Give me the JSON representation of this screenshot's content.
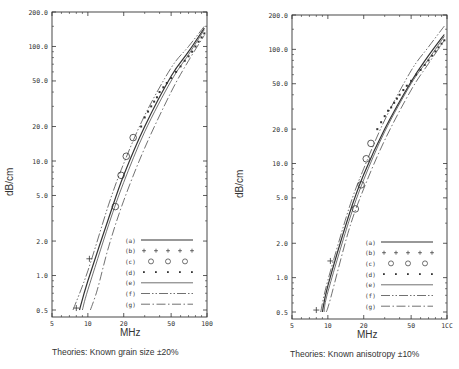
{
  "chart_data": [
    {
      "type": "line",
      "title": "",
      "caption": "Theories: Known grain size ±20%",
      "xlabel": "MHz",
      "ylabel": "dB/cm",
      "xscale": "log",
      "yscale": "log",
      "xlim": [
        5,
        100
      ],
      "ylim": [
        0.5,
        200
      ],
      "x_ticks": [
        "5",
        "10",
        "20",
        "50",
        "100"
      ],
      "y_ticks": [
        "200.0",
        "100.0",
        "50.0",
        "20.0",
        "10.0",
        "5.0",
        "2.0",
        "1.0",
        "0.5"
      ],
      "legend": [
        {
          "key": "(a)",
          "style": "solid"
        },
        {
          "key": "(b)",
          "style": "plus-markers"
        },
        {
          "key": "(c)",
          "style": "circle-markers"
        },
        {
          "key": "(d)",
          "style": "dot-markers"
        },
        {
          "key": "(e)",
          "style": "thin-solid"
        },
        {
          "key": "(f)",
          "style": "dash-dot-dot"
        },
        {
          "key": "(g)",
          "style": "dash-dot"
        }
      ],
      "legend_position": "lower right",
      "series": [
        {
          "name": "(a)",
          "x": [
            8.5,
            10,
            15,
            20,
            30,
            50,
            70,
            95
          ],
          "y": [
            0.5,
            0.9,
            3.2,
            7.5,
            20,
            55,
            90,
            145
          ]
        },
        {
          "name": "(b)",
          "x": [
            8,
            10.3
          ],
          "y": [
            0.52,
            1.4
          ]
        },
        {
          "name": "(c)",
          "x": [
            17,
            19,
            21,
            24
          ],
          "y": [
            4.0,
            7.5,
            11.0,
            16.0
          ]
        },
        {
          "name": "(d)",
          "x": [
            28,
            30,
            32,
            34,
            36,
            38,
            40,
            43,
            46,
            50,
            55,
            60,
            65,
            70,
            75,
            80,
            85,
            90,
            95
          ],
          "y": [
            20,
            24,
            27,
            30,
            33,
            36,
            40,
            44,
            48,
            53,
            60,
            67,
            75,
            82,
            90,
            100,
            110,
            120,
            130
          ]
        },
        {
          "name": "(e)",
          "x": [
            9,
            10,
            15,
            20,
            30,
            50,
            70,
            95
          ],
          "y": [
            0.5,
            0.75,
            2.8,
            6.5,
            18,
            50,
            85,
            140
          ]
        },
        {
          "name": "(f)",
          "x": [
            7.5,
            10,
            15,
            20,
            30,
            50,
            70,
            95
          ],
          "y": [
            0.5,
            1.1,
            4.2,
            9.5,
            25,
            65,
            100,
            150
          ]
        },
        {
          "name": "(g)",
          "x": [
            10.5,
            12,
            15,
            20,
            30,
            50,
            70,
            95
          ],
          "y": [
            0.5,
            0.75,
            1.8,
            4.5,
            13,
            40,
            75,
            125
          ]
        }
      ]
    },
    {
      "type": "line",
      "title": "",
      "caption": "Theories: Known anisotropy ±10%",
      "xlabel": "MHz",
      "ylabel": "dB/cm",
      "xscale": "log",
      "yscale": "log",
      "xlim": [
        5,
        100
      ],
      "ylim": [
        0.5,
        200
      ],
      "x_ticks": [
        "5",
        "10",
        "20",
        "50",
        "1CC"
      ],
      "y_ticks": [
        "200.0",
        "100.0",
        "50.0",
        "20.0",
        "10.0",
        "5.0",
        "2.0",
        "1.0",
        "0.5"
      ],
      "legend": [
        {
          "key": "(a)",
          "style": "solid"
        },
        {
          "key": "(b)",
          "style": "plus-markers"
        },
        {
          "key": "(c)",
          "style": "circle-markers"
        },
        {
          "key": "(d)",
          "style": "dot-markers"
        },
        {
          "key": "(e)",
          "style": "thin-solid"
        },
        {
          "key": "(f)",
          "style": "dash-dot-dot"
        },
        {
          "key": "(g)",
          "style": "dash-dot"
        }
      ],
      "legend_position": "lower right",
      "series": [
        {
          "name": "(a)",
          "x": [
            9,
            10,
            15,
            20,
            30,
            50,
            70,
            95
          ],
          "y": [
            0.5,
            0.85,
            3.5,
            8,
            20,
            52,
            88,
            135
          ]
        },
        {
          "name": "(b)",
          "x": [
            8,
            10.5
          ],
          "y": [
            0.52,
            1.4
          ]
        },
        {
          "name": "(c)",
          "x": [
            17,
            19,
            21,
            23
          ],
          "y": [
            4.0,
            6.5,
            11.0,
            15.0
          ]
        },
        {
          "name": "(d)",
          "x": [
            26,
            28,
            30,
            32,
            34,
            36,
            38,
            40,
            43,
            46,
            50,
            55,
            60,
            65,
            70,
            75,
            80,
            85,
            90,
            95
          ],
          "y": [
            20,
            23,
            26,
            29,
            31,
            34,
            37,
            40,
            44,
            48,
            53,
            60,
            66,
            73,
            80,
            88,
            96,
            104,
            112,
            120
          ]
        },
        {
          "name": "(e)",
          "x": [
            9.3,
            10,
            15,
            20,
            30,
            50,
            70,
            95
          ],
          "y": [
            0.5,
            0.75,
            3.1,
            7.2,
            19,
            50,
            82,
            130
          ]
        },
        {
          "name": "(f)",
          "x": [
            8.7,
            10,
            15,
            20,
            30,
            50,
            70,
            95
          ],
          "y": [
            0.5,
            0.95,
            4.0,
            9.0,
            24,
            65,
            105,
            160
          ]
        },
        {
          "name": "(g)",
          "x": [
            9.7,
            10.5,
            15,
            20,
            30,
            50,
            70,
            95
          ],
          "y": [
            0.5,
            0.65,
            2.6,
            6.0,
            16,
            44,
            75,
            120
          ]
        }
      ]
    }
  ],
  "panels": [
    {
      "ylabel": "dB/cm",
      "xlabel": "MHz",
      "caption": "Theories: Known grain size ±20%"
    },
    {
      "ylabel": "dB/cm",
      "xlabel": "MHz",
      "caption": "Theories: Known anisotropy ±10%"
    }
  ]
}
